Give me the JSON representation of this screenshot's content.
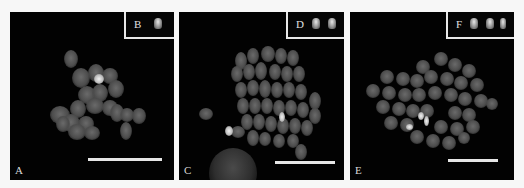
{
  "figure": {
    "panels": [
      {
        "id": "A",
        "label": "A",
        "inset_label": "B",
        "inset_signals": 1,
        "description": "metaphase chromosome spread with one bright FISH signal"
      },
      {
        "id": "C",
        "label": "C",
        "inset_label": "D",
        "inset_signals": 2,
        "description": "metaphase chromosome spread with two bright FISH signals and interphase nucleus"
      },
      {
        "id": "E",
        "label": "E",
        "inset_label": "F",
        "inset_signals": 3,
        "description": "metaphase chromosome spread with three bright FISH signals"
      }
    ],
    "scale_bar": "present, white, unlabeled",
    "colors": {
      "background": "#f7f7f7",
      "panel": "#020202",
      "chromosome": "#5a5a5a",
      "signal": "#f2f2f2",
      "border": "#e8e8e8"
    }
  }
}
